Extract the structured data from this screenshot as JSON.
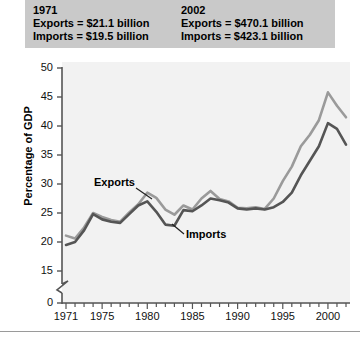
{
  "header": {
    "columns": [
      {
        "year": "1971",
        "exports": "Exports = $21.1 billion",
        "imports": "Imports = $19.5 billion"
      },
      {
        "year": "2002",
        "exports": "Exports = $470.1 billion",
        "imports": "Imports = $423.1 billion"
      }
    ]
  },
  "annotations": {
    "exports": "Exports",
    "imports": "Imports"
  },
  "colors": {
    "exports_line": "#9a9a9a",
    "imports_line": "#555555",
    "plot_background": "#f2f2f2",
    "header_background": "#c9c9c9",
    "axis": "#555555"
  },
  "chart_data": {
    "type": "line",
    "title": "",
    "subtitle": "",
    "xlabel": "",
    "ylabel": "Percentage of GDP",
    "xlim": [
      1971,
      2002
    ],
    "ylim": [
      15,
      50
    ],
    "y_axis_break": true,
    "y_break_between": [
      0,
      15
    ],
    "grid": false,
    "legend": "inline-annotations",
    "ytick_labels": [
      "0",
      "15",
      "20",
      "25",
      "30",
      "35",
      "40",
      "45",
      "50"
    ],
    "ytick_values": [
      0,
      15,
      20,
      25,
      30,
      35,
      40,
      45,
      50
    ],
    "xtick_labels": [
      "1971",
      "1975",
      "1980",
      "1985",
      "1990",
      "1995",
      "2000"
    ],
    "xtick_values": [
      1971,
      1975,
      1980,
      1985,
      1990,
      1995,
      2000
    ],
    "x_minor_tick_interval": 1,
    "x": [
      1971,
      1972,
      1973,
      1974,
      1975,
      1976,
      1977,
      1978,
      1979,
      1980,
      1981,
      1982,
      1983,
      1984,
      1985,
      1986,
      1987,
      1988,
      1989,
      1990,
      1991,
      1992,
      1993,
      1994,
      1995,
      1996,
      1997,
      1998,
      1999,
      2000,
      2001,
      2002
    ],
    "series": [
      {
        "name": "Exports",
        "color": "#9a9a9a",
        "values": [
          21.1,
          20.6,
          22.5,
          25.0,
          24.3,
          23.8,
          23.5,
          25.1,
          26.5,
          28.5,
          27.6,
          25.6,
          24.7,
          26.3,
          25.6,
          27.5,
          28.8,
          27.4,
          27.0,
          25.9,
          25.8,
          26.0,
          25.7,
          27.5,
          30.5,
          33.0,
          36.5,
          38.5,
          41.0,
          45.8,
          43.5,
          41.5
        ]
      },
      {
        "name": "Imports",
        "color": "#555555",
        "values": [
          19.5,
          20.0,
          22.0,
          24.8,
          23.9,
          23.5,
          23.3,
          24.8,
          26.3,
          27.0,
          25.2,
          23.0,
          22.8,
          25.5,
          25.3,
          26.3,
          27.5,
          27.2,
          26.8,
          25.8,
          25.6,
          25.8,
          25.6,
          26.0,
          26.9,
          28.5,
          31.5,
          34.0,
          36.5,
          40.5,
          39.5,
          36.8
        ]
      }
    ]
  }
}
